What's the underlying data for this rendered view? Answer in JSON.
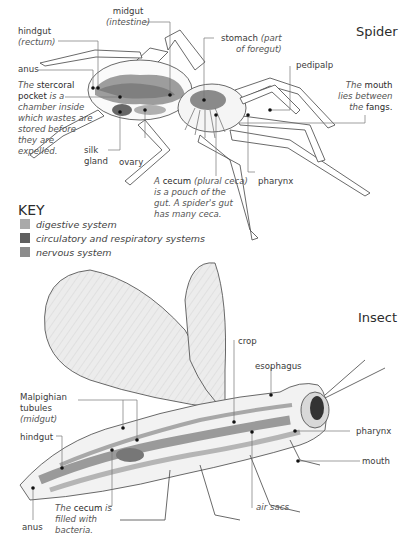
{
  "spider": {
    "title": "Spider",
    "labels": {
      "midgut": "midgut",
      "midgut_sub": "(intestine)",
      "hindgut": "hindgut",
      "hindgut_sub": "(rectum)",
      "anus": "anus",
      "stomach": "stomach",
      "stomach_sub1": "(part",
      "stomach_sub2": "of foregut)",
      "pedipalp": "pedipalp",
      "mouth_note": [
        "The",
        "mouth",
        "lies between",
        "the",
        "fangs."
      ],
      "stercoral_note": [
        "The",
        "stercoral",
        "pocket",
        "is a",
        "chamber inside",
        "which wastes are",
        "stored before",
        "they are",
        "expelled."
      ],
      "silk_gland": [
        "silk",
        "gland"
      ],
      "ovary": "ovary",
      "pharynx": "pharynx",
      "cecum_note": [
        "A",
        "cecum",
        "(plural ceca)",
        "is a pouch of the",
        "gut. A spider's gut",
        "has many ceca."
      ]
    }
  },
  "key": {
    "title": "KEY",
    "items": [
      {
        "label": "digestive system",
        "color": "#a9a9a9"
      },
      {
        "label": "circulatory and respiratory systems",
        "color": "#5f5f5f"
      },
      {
        "label": "nervous system",
        "color": "#8c8c8c"
      }
    ]
  },
  "insect": {
    "title": "Insect",
    "labels": {
      "crop": "crop",
      "esophagus": "esophagus",
      "malpighian": [
        "Malpighian",
        "tubules",
        "(midgut)"
      ],
      "hindgut": "hindgut",
      "pharynx": "pharynx",
      "mouth": "mouth",
      "air_sacs": "air sacs",
      "anus": "anus",
      "cecum_note": [
        "The",
        "cecum",
        "is",
        "filled with",
        "bacteria."
      ]
    }
  }
}
